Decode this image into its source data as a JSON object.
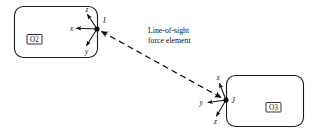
{
  "figure": {
    "type": "mechanical-schematic",
    "background_color": "#ffffff",
    "line_color": "#111111",
    "bodies": [
      {
        "id": "body-left",
        "tag": "O2",
        "attachment_point": "I",
        "axes": [
          {
            "name": "x",
            "label": "x"
          },
          {
            "name": "y",
            "label": "y"
          },
          {
            "name": "z",
            "label": "z"
          }
        ]
      },
      {
        "id": "body-right",
        "tag": "O3",
        "attachment_point": "J",
        "axes": [
          {
            "name": "x",
            "label": "x"
          },
          {
            "name": "y",
            "label": "y"
          },
          {
            "name": "z",
            "label": "z"
          }
        ]
      }
    ],
    "connector": {
      "label_line_1": "Line-of-sight",
      "label_line_2": "force element",
      "style": "dashed",
      "arrowheads": "both"
    }
  }
}
